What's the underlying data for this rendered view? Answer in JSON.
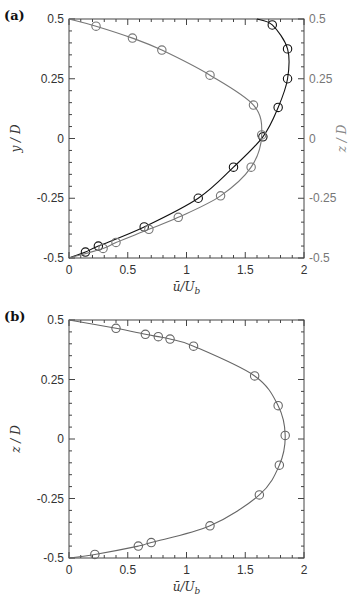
{
  "chart_data": [
    {
      "panel": "(a)",
      "type": "line",
      "xlabel": "ū/U_b",
      "ylabel_left": "y/D",
      "ylabel_right": "z/D",
      "xlim": [
        0,
        2
      ],
      "ylim": [
        -0.5,
        0.5
      ],
      "xticks": [
        "0",
        "0.5",
        "1",
        "1.5",
        "2"
      ],
      "yticks": [
        "0.5",
        "0.25",
        "0",
        "-0.25",
        "-0.5"
      ],
      "series": [
        {
          "name": "y/D profile (black)",
          "color": "#111111",
          "axis": "left",
          "points": [
            [
              0.14,
              -0.475
            ],
            [
              0.25,
              -0.45
            ],
            [
              0.64,
              -0.37
            ],
            [
              1.1,
              -0.25
            ],
            [
              1.4,
              -0.12
            ],
            [
              1.65,
              0.007
            ],
            [
              1.78,
              0.13
            ],
            [
              1.86,
              0.25
            ],
            [
              1.86,
              0.375
            ],
            [
              1.73,
              0.475
            ]
          ]
        },
        {
          "name": "z/D profile (gray)",
          "color": "#777777",
          "axis": "right",
          "points": [
            [
              0.29,
              -0.46
            ],
            [
              0.4,
              -0.435
            ],
            [
              0.68,
              -0.38
            ],
            [
              0.93,
              -0.33
            ],
            [
              1.29,
              -0.24
            ],
            [
              1.55,
              -0.12
            ],
            [
              1.64,
              0.015
            ],
            [
              1.57,
              0.14
            ],
            [
              1.2,
              0.265
            ],
            [
              0.79,
              0.37
            ],
            [
              0.54,
              0.42
            ],
            [
              0.23,
              0.47
            ]
          ]
        }
      ]
    },
    {
      "panel": "(b)",
      "type": "line",
      "xlabel": "ū/U_b",
      "ylabel": "z/D",
      "xlim": [
        0,
        2
      ],
      "ylim": [
        -0.5,
        0.5
      ],
      "xticks": [
        "0",
        "0.5",
        "1",
        "1.5",
        "2"
      ],
      "yticks": [
        "0.5",
        "0.25",
        "0",
        "-0.25",
        "-0.5"
      ],
      "series": [
        {
          "name": "z/D profile",
          "color": "#666666",
          "points": [
            [
              0.22,
              -0.485
            ],
            [
              0.59,
              -0.45
            ],
            [
              0.7,
              -0.435
            ],
            [
              1.2,
              -0.365
            ],
            [
              1.62,
              -0.235
            ],
            [
              1.79,
              -0.11
            ],
            [
              1.84,
              0.015
            ],
            [
              1.78,
              0.14
            ],
            [
              1.58,
              0.265
            ],
            [
              1.06,
              0.39
            ],
            [
              0.86,
              0.42
            ],
            [
              0.76,
              0.43
            ],
            [
              0.65,
              0.44
            ],
            [
              0.4,
              0.465
            ]
          ]
        }
      ]
    }
  ],
  "labels": {
    "panel_a": "(a)",
    "panel_b": "(b)",
    "xlabel": "ū/U",
    "xlabel_sub": "b",
    "ylabel_a_left": "y / D",
    "ylabel_a_right": "z / D",
    "ylabel_b": "z / D"
  }
}
